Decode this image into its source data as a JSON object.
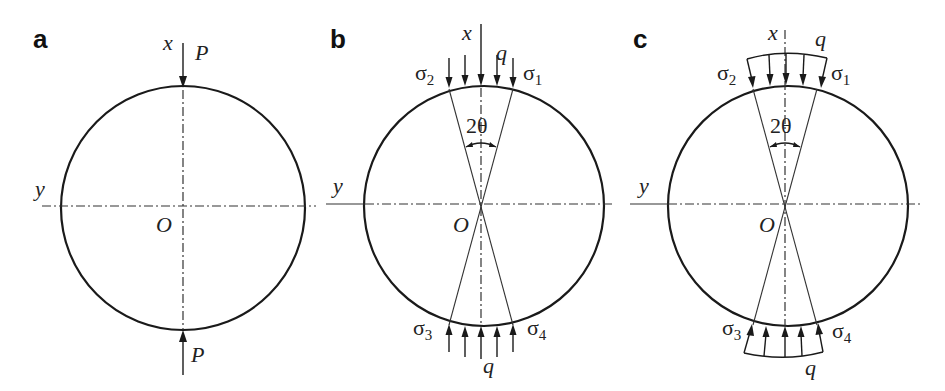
{
  "figure": {
    "panels": [
      {
        "id": "a",
        "label": "a",
        "center_label": "O",
        "x_axis_label": "x",
        "y_axis_label": "y",
        "load_top_label": "P",
        "load_bottom_label": "P",
        "load_type": "concentrated"
      },
      {
        "id": "b",
        "label": "b",
        "center_label": "O",
        "x_axis_label": "x",
        "y_axis_label": "y",
        "load_top_label": "q",
        "load_bottom_label": "q",
        "angle_label": "2θ",
        "stress_labels": {
          "s1": {
            "sym": "σ",
            "sub": "1"
          },
          "s2": {
            "sym": "σ",
            "sub": "2"
          },
          "s3": {
            "sym": "σ",
            "sub": "3"
          },
          "s4": {
            "sym": "σ",
            "sub": "4"
          }
        },
        "load_type": "uniform-parallel"
      },
      {
        "id": "c",
        "label": "c",
        "center_label": "O",
        "x_axis_label": "x",
        "y_axis_label": "y",
        "load_top_label": "q",
        "load_bottom_label": "q",
        "angle_label": "2θ",
        "stress_labels": {
          "s1": {
            "sym": "σ",
            "sub": "1"
          },
          "s2": {
            "sym": "σ",
            "sub": "2"
          },
          "s3": {
            "sym": "σ",
            "sub": "3"
          },
          "s4": {
            "sym": "σ",
            "sub": "4"
          }
        },
        "load_type": "uniform-radial"
      }
    ],
    "colors": {
      "stroke": "#1a1a1a",
      "background": "#ffffff"
    }
  }
}
